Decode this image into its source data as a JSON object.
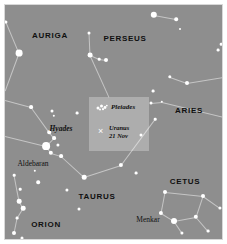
{
  "chart_data": {
    "type": "scatter",
    "xlabel": "",
    "ylabel": "",
    "xlim": [
      0,
      219
    ],
    "ylim": [
      0,
      236
    ],
    "grid": false,
    "legend": "none",
    "background_color": "#8e8e8e",
    "star_color": "#ffffff",
    "line_color": "#cfcfcf",
    "label_color": "#101010",
    "constellations": [
      {
        "name": "AURIGA",
        "x": 45,
        "y": 30
      },
      {
        "name": "PERSEUS",
        "x": 120,
        "y": 33
      },
      {
        "name": "ARIES",
        "x": 184,
        "y": 105
      },
      {
        "name": "TAURUS",
        "x": 92,
        "y": 191
      },
      {
        "name": "ORION",
        "x": 41,
        "y": 219
      },
      {
        "name": "CETUS",
        "x": 180,
        "y": 176
      }
    ],
    "named_objects": [
      {
        "name": "Hyades",
        "x": 56,
        "y": 123,
        "style": "italic"
      },
      {
        "name": "Aldebaran",
        "x": 28,
        "y": 158,
        "style": "roman"
      },
      {
        "name": "Menkar",
        "x": 143,
        "y": 214,
        "style": "roman"
      }
    ],
    "stars": [
      {
        "x": 14,
        "y": 48,
        "r": 3.4
      },
      {
        "x": 1,
        "y": 17,
        "r": 1.6
      },
      {
        "x": 84,
        "y": 28,
        "r": 1.5
      },
      {
        "x": 85,
        "y": 50,
        "r": 2.4
      },
      {
        "x": 94,
        "y": 54,
        "r": 1.3
      },
      {
        "x": 101,
        "y": 55,
        "r": 2.0
      },
      {
        "x": 149,
        "y": 10,
        "r": 3.2
      },
      {
        "x": 171,
        "y": 14,
        "r": 1.8
      },
      {
        "x": 175,
        "y": 24,
        "r": 1.0
      },
      {
        "x": 213,
        "y": 45,
        "r": 1.4
      },
      {
        "x": 165,
        "y": 72,
        "r": 1.7
      },
      {
        "x": 182,
        "y": 78,
        "r": 2.0
      },
      {
        "x": 216,
        "y": 39,
        "r": 1.3
      },
      {
        "x": 148,
        "y": 86,
        "r": 1.4
      },
      {
        "x": 146,
        "y": 98,
        "r": 1.5
      },
      {
        "x": 157,
        "y": 97,
        "r": 1.2
      },
      {
        "x": 26,
        "y": 102,
        "r": 1.9
      },
      {
        "x": 72,
        "y": 108,
        "r": 1.4
      },
      {
        "x": 47,
        "y": 106,
        "r": 1.5
      },
      {
        "x": 49,
        "y": 111,
        "r": 1.2
      },
      {
        "x": 44,
        "y": 127,
        "r": 1.8
      },
      {
        "x": 49,
        "y": 133,
        "r": 1.9
      },
      {
        "x": 53,
        "y": 140,
        "r": 1.6
      },
      {
        "x": 41,
        "y": 141,
        "r": 3.9
      },
      {
        "x": 46,
        "y": 148,
        "r": 2.2
      },
      {
        "x": 56,
        "y": 151,
        "r": 1.9
      },
      {
        "x": 150,
        "y": 114,
        "r": 1.3
      },
      {
        "x": 9,
        "y": 170,
        "r": 1.3
      },
      {
        "x": 30,
        "y": 166,
        "r": 1.2
      },
      {
        "x": 33,
        "y": 177,
        "r": 1.8
      },
      {
        "x": 15,
        "y": 184,
        "r": 1.3
      },
      {
        "x": 14,
        "y": 196,
        "r": 2.3
      },
      {
        "x": 18,
        "y": 203,
        "r": 2.3
      },
      {
        "x": 12,
        "y": 213,
        "r": 1.4
      },
      {
        "x": 9,
        "y": 228,
        "r": 2.0
      },
      {
        "x": 17,
        "y": 233,
        "r": 1.5
      },
      {
        "x": 62,
        "y": 185,
        "r": 1.6
      },
      {
        "x": 74,
        "y": 204,
        "r": 1.5
      },
      {
        "x": 116,
        "y": 160,
        "r": 2.1
      },
      {
        "x": 79,
        "y": 172,
        "r": 2.3
      },
      {
        "x": 131,
        "y": 168,
        "r": 1.4
      },
      {
        "x": 136,
        "y": 130,
        "r": 1.5
      },
      {
        "x": 160,
        "y": 187,
        "r": 2.0
      },
      {
        "x": 156,
        "y": 208,
        "r": 2.1
      },
      {
        "x": 198,
        "y": 191,
        "r": 2.0
      },
      {
        "x": 191,
        "y": 212,
        "r": 2.2
      },
      {
        "x": 215,
        "y": 203,
        "r": 1.6
      },
      {
        "x": 169,
        "y": 216,
        "r": 3.0
      },
      {
        "x": 177,
        "y": 228,
        "r": 1.6
      },
      {
        "x": 203,
        "y": 226,
        "r": 1.4
      }
    ],
    "lines": [
      {
        "x1": 1,
        "y1": 17,
        "x2": 14,
        "y2": 48
      },
      {
        "x1": 14,
        "y1": 48,
        "x2": 0,
        "y2": 86
      },
      {
        "x1": 84,
        "y1": 28,
        "x2": 85,
        "y2": 50
      },
      {
        "x1": 85,
        "y1": 50,
        "x2": 94,
        "y2": 54
      },
      {
        "x1": 94,
        "y1": 54,
        "x2": 101,
        "y2": 55
      },
      {
        "x1": 85,
        "y1": 50,
        "x2": 104,
        "y2": 92
      },
      {
        "x1": 149,
        "y1": 10,
        "x2": 171,
        "y2": 14
      },
      {
        "x1": 165,
        "y1": 72,
        "x2": 182,
        "y2": 78
      },
      {
        "x1": 182,
        "y1": 78,
        "x2": 219,
        "y2": 72
      },
      {
        "x1": 146,
        "y1": 98,
        "x2": 157,
        "y2": 97
      },
      {
        "x1": 157,
        "y1": 97,
        "x2": 219,
        "y2": 112
      },
      {
        "x1": 0,
        "y1": 95,
        "x2": 26,
        "y2": 102
      },
      {
        "x1": 26,
        "y1": 102,
        "x2": 44,
        "y2": 127
      },
      {
        "x1": 44,
        "y1": 127,
        "x2": 49,
        "y2": 133
      },
      {
        "x1": 49,
        "y1": 133,
        "x2": 41,
        "y2": 141
      },
      {
        "x1": 41,
        "y1": 141,
        "x2": 46,
        "y2": 148
      },
      {
        "x1": 46,
        "y1": 148,
        "x2": 56,
        "y2": 151
      },
      {
        "x1": 0,
        "y1": 131,
        "x2": 41,
        "y2": 141
      },
      {
        "x1": 56,
        "y1": 151,
        "x2": 79,
        "y2": 172
      },
      {
        "x1": 79,
        "y1": 172,
        "x2": 116,
        "y2": 160
      },
      {
        "x1": 116,
        "y1": 160,
        "x2": 150,
        "y2": 114
      },
      {
        "x1": 9,
        "y1": 170,
        "x2": 14,
        "y2": 196
      },
      {
        "x1": 14,
        "y1": 196,
        "x2": 18,
        "y2": 203
      },
      {
        "x1": 18,
        "y1": 203,
        "x2": 12,
        "y2": 213
      },
      {
        "x1": 12,
        "y1": 213,
        "x2": 9,
        "y2": 228
      },
      {
        "x1": 160,
        "y1": 187,
        "x2": 156,
        "y2": 208
      },
      {
        "x1": 156,
        "y1": 208,
        "x2": 169,
        "y2": 216
      },
      {
        "x1": 169,
        "y1": 216,
        "x2": 191,
        "y2": 212
      },
      {
        "x1": 191,
        "y1": 212,
        "x2": 198,
        "y2": 191
      },
      {
        "x1": 198,
        "y1": 191,
        "x2": 160,
        "y2": 187
      },
      {
        "x1": 191,
        "y1": 212,
        "x2": 203,
        "y2": 226
      },
      {
        "x1": 198,
        "y1": 191,
        "x2": 215,
        "y2": 203
      },
      {
        "x1": 169,
        "y1": 216,
        "x2": 177,
        "y2": 228
      }
    ]
  },
  "inset": {
    "pleiades_label": "Pleiades",
    "uranus_label": "Uranus",
    "uranus_date": "21 Nov",
    "uranus_marker": "×"
  }
}
